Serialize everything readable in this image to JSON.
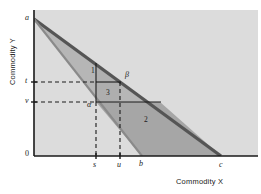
{
  "figure": {
    "axes": {
      "x_title": "Commodity X",
      "y_title": "Commodity Y"
    },
    "y_ticks": [
      {
        "label": "a",
        "y": 19
      },
      {
        "label": "t",
        "y": 82
      },
      {
        "label": "v",
        "y": 102
      },
      {
        "label": "0",
        "y": 156
      }
    ],
    "x_ticks": [
      {
        "label": "s",
        "x": 96
      },
      {
        "label": "u",
        "x": 120
      },
      {
        "label": "b",
        "x": 142
      },
      {
        "label": "c",
        "x": 221
      }
    ],
    "region_labels": [
      {
        "label": "1",
        "x": 92,
        "y": 70
      },
      {
        "label": "2",
        "x": 146,
        "y": 119
      },
      {
        "label": "3",
        "x": 108,
        "y": 92
      }
    ],
    "point_labels": [
      {
        "label": "α",
        "x": 88,
        "y": 104
      },
      {
        "label": "β",
        "x": 127,
        "y": 75
      }
    ],
    "colors": {
      "plot_background": "#dcdcdc",
      "band_fill": "#b9b9b9",
      "band_edge": "#6f6f6f",
      "region_two_fill": "#a8a8a8",
      "region_three_fill": "#b0b0b0",
      "axis": "#1a1a1a",
      "dashed": "#1a1a1a",
      "page_background": "#ffffff"
    },
    "geometry": {
      "origin": {
        "x": 34,
        "y": 156
      },
      "apex_a": {
        "x": 34,
        "y": 19
      },
      "line_ab_end": {
        "x": 142,
        "y": 156
      },
      "line_ac_end": {
        "x": 221,
        "y": 156
      },
      "x_axis_end": {
        "x": 258,
        "y": 156
      },
      "y_axis_top": {
        "x": 34,
        "y": 10
      }
    }
  }
}
